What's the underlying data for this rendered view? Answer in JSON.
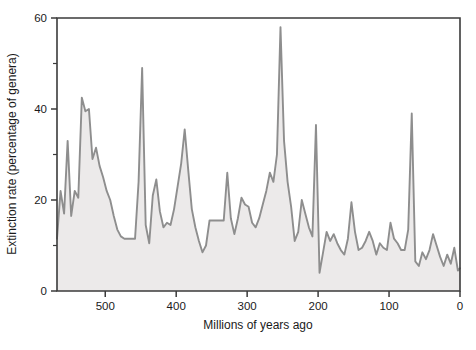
{
  "chart_data": {
    "type": "area",
    "title": "",
    "xlabel": "Millions of years ago",
    "ylabel": "Extinction rate (percentage of genera)",
    "xlim": [
      568,
      0
    ],
    "ylim": [
      0,
      60
    ],
    "x_reversed": true,
    "grid": false,
    "legend": null,
    "xticks": [
      500,
      400,
      300,
      200,
      100,
      0
    ],
    "xtick_labels": [
      "500",
      "400",
      "300",
      "200",
      "100",
      "0"
    ],
    "yticks": [
      0,
      20,
      40,
      60
    ],
    "ytick_labels": [
      "0",
      "20",
      "40",
      "60"
    ],
    "y_minor_ticks": [
      10,
      30,
      50
    ],
    "line_color": "#8e8e8e",
    "fill_color": "#eceaea",
    "axis_color": "#3b3b3b",
    "series_name": "Extinction rate",
    "x": [
      568,
      563,
      558,
      553,
      548,
      543,
      538,
      533,
      528,
      523,
      518,
      513,
      508,
      503,
      498,
      493,
      488,
      483,
      478,
      473,
      468,
      463,
      458,
      453,
      448,
      443,
      438,
      433,
      428,
      423,
      418,
      413,
      408,
      403,
      398,
      393,
      388,
      383,
      378,
      373,
      368,
      363,
      358,
      353,
      348,
      343,
      338,
      333,
      328,
      323,
      318,
      313,
      308,
      303,
      298,
      293,
      288,
      283,
      278,
      273,
      268,
      263,
      258,
      253,
      248,
      243,
      238,
      233,
      228,
      223,
      218,
      213,
      208,
      203,
      198,
      193,
      188,
      183,
      178,
      173,
      168,
      163,
      158,
      153,
      148,
      143,
      138,
      133,
      128,
      123,
      118,
      113,
      108,
      103,
      98,
      93,
      88,
      83,
      78,
      73,
      68,
      63,
      58,
      53,
      48,
      43,
      38,
      33,
      28,
      23,
      18,
      13,
      8,
      3,
      0
    ],
    "y": [
      11.5,
      22.0,
      17.0,
      33.0,
      16.5,
      22.0,
      20.5,
      42.5,
      39.5,
      40.0,
      29.0,
      31.5,
      27.5,
      25.0,
      22.0,
      20.0,
      16.5,
      13.5,
      12.0,
      11.5,
      11.5,
      11.5,
      11.5,
      24.0,
      49.0,
      14.5,
      10.5,
      21.0,
      24.5,
      17.5,
      14.0,
      15.0,
      14.5,
      18.0,
      23.0,
      28.0,
      35.5,
      26.5,
      18.0,
      14.0,
      11.0,
      8.5,
      10.0,
      15.5,
      15.5,
      15.5,
      15.5,
      15.5,
      26.0,
      16.0,
      12.5,
      16.0,
      20.5,
      19.0,
      18.5,
      15.0,
      14.0,
      16.0,
      19.0,
      22.0,
      26.0,
      24.0,
      30.0,
      58.0,
      33.0,
      24.0,
      18.5,
      11.0,
      13.0,
      20.0,
      17.0,
      14.0,
      12.0,
      36.5,
      4.0,
      8.5,
      13.0,
      11.0,
      12.5,
      10.5,
      9.0,
      8.0,
      11.5,
      19.5,
      13.0,
      9.0,
      9.5,
      11.0,
      13.0,
      11.0,
      8.0,
      10.5,
      9.5,
      9.0,
      15.0,
      11.5,
      10.5,
      9.0,
      9.0,
      13.5,
      39.0,
      6.5,
      5.5,
      8.5,
      7.0,
      9.0,
      12.5,
      10.0,
      7.5,
      5.5,
      8.0,
      6.0,
      9.5,
      4.5,
      5.0
    ],
    "annotations": []
  },
  "axes": {
    "ylabel_text": "Extinction rate (percentage of genera)",
    "xlabel_text": "Millions of years ago"
  }
}
